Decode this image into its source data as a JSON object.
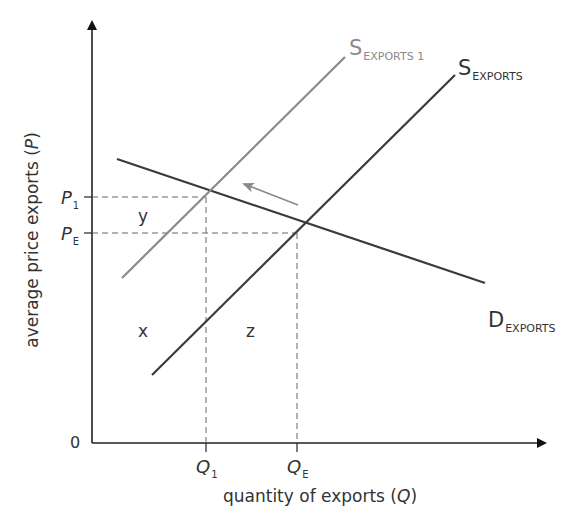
{
  "diagram": {
    "type": "supply-demand",
    "axes": {
      "y_label": "average price exports (P)",
      "y_label_main": "average price exports (",
      "y_label_var": "P",
      "y_label_close": ")",
      "x_label_main": "quantity of exports (",
      "x_label_var": "Q",
      "x_label_close": ")",
      "origin": "0"
    },
    "price_ticks": [
      {
        "main": "P",
        "sub": "1"
      },
      {
        "main": "P",
        "sub": "E"
      }
    ],
    "quantity_ticks": [
      {
        "main": "Q",
        "sub": "1"
      },
      {
        "main": "Q",
        "sub": "E"
      }
    ],
    "curves": {
      "supply_shifted": {
        "main": "S",
        "sub": "EXPORTS 1",
        "color": "#8a8a8a"
      },
      "supply": {
        "main": "S",
        "sub": "EXPORTS",
        "color": "#3a3a3a"
      },
      "demand": {
        "main": "D",
        "sub": "EXPORTS",
        "color": "#3a3a3a"
      }
    },
    "regions": {
      "y": "y",
      "x": "x",
      "z": "z"
    },
    "shift_arrow": {
      "direction": "left",
      "color": "#8a8a8a"
    }
  }
}
